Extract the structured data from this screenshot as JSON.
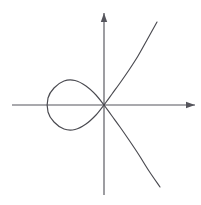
{
  "figure": {
    "width": 201,
    "height": 205,
    "background_color": "#ffffff"
  },
  "style": {
    "curve_color": "#4a4a50",
    "curve_width": 1.15,
    "axis_color": "#55555c",
    "axis_width": 1.15
  },
  "chart_data": {
    "type": "line",
    "title": "",
    "subtitle": "",
    "xlabel": "",
    "ylabel": "",
    "grid": false,
    "legend": null,
    "annotations": [],
    "tick_labels": {
      "x": [],
      "y": []
    },
    "curve_equation": "y^2 = x^2 * (x + 1)",
    "axis_ranges": {
      "xlim": [
        -2.0,
        2.0
      ],
      "ylim": [
        -2.0,
        2.0
      ]
    },
    "origin_px": {
      "x": 104,
      "y": 105
    },
    "pixels_per_unit": {
      "x": 56,
      "y": 56
    },
    "axes": {
      "x_axis": {
        "name": "x-axis",
        "start_px": {
          "x": 12,
          "y": 105
        },
        "end_px": {
          "x": 195,
          "y": 105
        },
        "arrow_at": "end",
        "arrow_direction": "right"
      },
      "y_axis": {
        "name": "y-axis",
        "start_px": {
          "x": 104,
          "y": 195
        },
        "end_px": {
          "x": 104,
          "y": 13
        },
        "arrow_at": "end",
        "arrow_direction": "up"
      }
    },
    "series": [
      {
        "name": "loop",
        "closed": true,
        "node_px": {
          "x": 104,
          "y": 105
        },
        "leftmost_px": {
          "x": 48,
          "y": 105
        },
        "top_px": {
          "x": 75,
          "y": 80
        },
        "bottom_px": {
          "x": 75,
          "y": 130
        },
        "points_px": [
          [
            104,
            105
          ],
          [
            96,
            95
          ],
          [
            86,
            86
          ],
          [
            75,
            80.5
          ],
          [
            64,
            81
          ],
          [
            54,
            88
          ],
          [
            48,
            98
          ],
          [
            48,
            112
          ],
          [
            54,
            122
          ],
          [
            64,
            129
          ],
          [
            75,
            129.5
          ],
          [
            86,
            124
          ],
          [
            96,
            115
          ],
          [
            104,
            105
          ]
        ]
      },
      {
        "name": "upper-right-branch",
        "closed": false,
        "points_px": [
          [
            104,
            105
          ],
          [
            112,
            94
          ],
          [
            120,
            83
          ],
          [
            129,
            70
          ],
          [
            138,
            56
          ],
          [
            147,
            40
          ],
          [
            157,
            22
          ]
        ]
      },
      {
        "name": "lower-right-branch",
        "closed": false,
        "points_px": [
          [
            104,
            105
          ],
          [
            112,
            116
          ],
          [
            120,
            127
          ],
          [
            129,
            140
          ],
          [
            139,
            155
          ],
          [
            149,
            171
          ],
          [
            160,
            187
          ]
        ]
      }
    ]
  }
}
